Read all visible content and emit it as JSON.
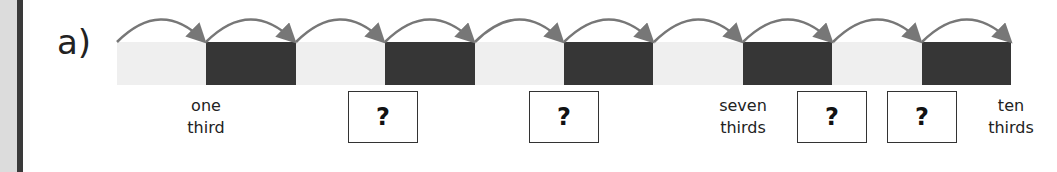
{
  "question": {
    "label": "a)"
  },
  "number_line": {
    "segments": [
      "light",
      "dark",
      "light",
      "dark",
      "light",
      "dark",
      "light",
      "dark",
      "light",
      "dark"
    ],
    "colors": {
      "light": "#efefef",
      "dark": "#363636",
      "arrow": "#777777"
    },
    "jumps": 10
  },
  "labels": {
    "one_third": {
      "line1": "one",
      "line2": "third"
    },
    "seven_thirds": {
      "line1": "seven",
      "line2": "thirds"
    },
    "ten_thirds": {
      "line1": "ten",
      "line2": "thirds"
    }
  },
  "answer_boxes": [
    {
      "text": "?"
    },
    {
      "text": "?"
    },
    {
      "text": "?"
    },
    {
      "text": "?"
    }
  ]
}
